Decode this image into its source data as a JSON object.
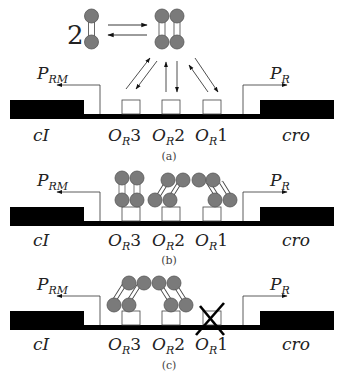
{
  "figure": {
    "type": "lambda phage OR operator binding schematic",
    "colors": {
      "dna": "#000000",
      "protein": "#777777",
      "protein_edge": "#555555",
      "line": "#333333"
    },
    "reaction": {
      "coefficient": "2",
      "reactant": "dimer",
      "product": "tetramer",
      "arrows": "reversible"
    },
    "labels": {
      "left_gene": "cI",
      "right_gene": "cro",
      "promoter_left_main": "P",
      "promoter_left_sub": "RM",
      "promoter_right_main": "P",
      "promoter_right_sub": "R",
      "operators": [
        {
          "main": "O",
          "sub": "R",
          "num": "3"
        },
        {
          "main": "O",
          "sub": "R",
          "num": "2"
        },
        {
          "main": "O",
          "sub": "R",
          "num": "1"
        }
      ]
    },
    "panels": [
      {
        "caption": "(a)",
        "state": "free dimers exchanging with operator sites"
      },
      {
        "caption": "(b)",
        "state": "dimers bound at OR3, OR2, OR1 forming octamer loop"
      },
      {
        "caption": "(c)",
        "state": "OR1 deleted, dimers bound at OR3 and OR2"
      }
    ]
  }
}
